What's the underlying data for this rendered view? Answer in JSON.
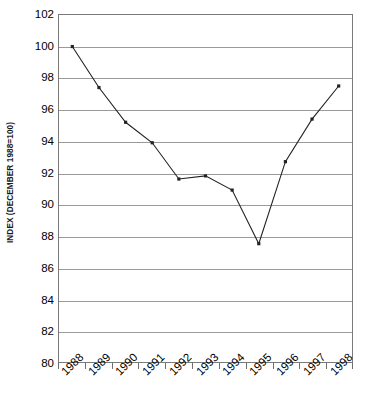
{
  "chart_data": {
    "type": "line",
    "title": "",
    "subtitle": "",
    "xlabel": "",
    "ylabel": "INDEX (DECEMBER 1988=100)",
    "categories": [
      "1988",
      "1989",
      "1990",
      "1991",
      "1992",
      "1993",
      "1994",
      "1995",
      "1996",
      "1997",
      "1998"
    ],
    "values": [
      100.0,
      97.4,
      95.2,
      93.9,
      91.6,
      91.8,
      90.9,
      87.5,
      92.7,
      95.4,
      97.5
    ],
    "series": [
      {
        "name": "Index",
        "values": [
          100.0,
          97.4,
          95.2,
          93.9,
          91.6,
          91.8,
          90.9,
          87.5,
          92.7,
          95.4,
          97.5
        ]
      }
    ],
    "ylim": [
      80,
      102
    ],
    "ytick_step": 2,
    "yticks": [
      80,
      82,
      84,
      86,
      88,
      90,
      92,
      94,
      96,
      98,
      100,
      102
    ],
    "ytick_labels": [
      "80",
      "82",
      "84",
      "86",
      "88",
      "90",
      "92",
      "94",
      "96",
      "98",
      "100",
      "102"
    ],
    "grid": "horizontal",
    "legend": "none",
    "marker": "square",
    "line_color": "#222222",
    "grid_color": "#9a9a9a",
    "axis_color": "#7a7a7a",
    "background_color": "#ffffff",
    "xlabel_rotation": -45,
    "annotations": []
  }
}
